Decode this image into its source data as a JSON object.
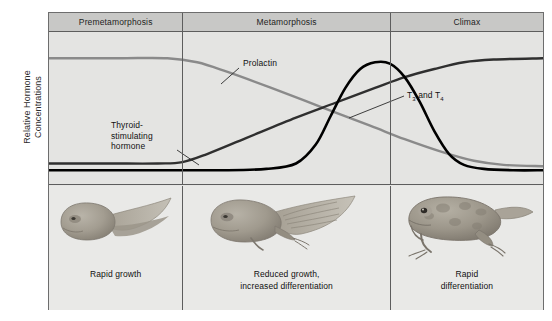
{
  "axis": {
    "y_title_line1": "Relative Hormone",
    "y_title_line2": "Concentrations"
  },
  "phases": [
    {
      "label": "Premetamorphosis"
    },
    {
      "label": "Metamorphosis"
    },
    {
      "label": "Climax"
    }
  ],
  "curve_labels": {
    "prolactin": "Prolactin",
    "tsh_line1": "Thyroid-",
    "tsh_line2": "stimulating",
    "tsh_line3": "hormone",
    "t3t4_prefix": "T",
    "t3t4_sub1": "3",
    "t3t4_mid": " and T",
    "t3t4_sub2": "4"
  },
  "stages": [
    {
      "caption_line1": "Rapid growth",
      "caption_line2": "",
      "art": "tadpole"
    },
    {
      "caption_line1": "Reduced growth,",
      "caption_line2": "increased differentiation",
      "art": "limbed-tadpole"
    },
    {
      "caption_line1": "Rapid",
      "caption_line2": "differentiation",
      "art": "froglet"
    }
  ],
  "colors": {
    "prolactin": "#8a8a8a",
    "tsh": "#2f2f2f",
    "t3t4": "#000000",
    "frame": "#6d6d6d",
    "header_band": "#c8c8c6",
    "plot_bg": "#e4e4e2",
    "strip_bg": "#e9e9e7"
  },
  "chart_data": {
    "type": "line",
    "title": "",
    "xlabel": "",
    "ylabel": "Relative Hormone Concentrations",
    "grid": false,
    "legend": "inline-annotations",
    "x_categories": [
      "Premetamorphosis",
      "Metamorphosis",
      "Climax"
    ],
    "x_boundaries_pct": [
      0,
      27,
      69,
      100
    ],
    "ylim": [
      0,
      100
    ],
    "xlim": [
      0,
      100
    ],
    "series": [
      {
        "name": "Prolactin",
        "color": "#8a8a8a",
        "points": [
          [
            0,
            88
          ],
          [
            14,
            88
          ],
          [
            24,
            88
          ],
          [
            30,
            85
          ],
          [
            36,
            78
          ],
          [
            45,
            66
          ],
          [
            55,
            52
          ],
          [
            65,
            38
          ],
          [
            72,
            28
          ],
          [
            80,
            18
          ],
          [
            86,
            12
          ],
          [
            92,
            9
          ],
          [
            100,
            8
          ]
        ]
      },
      {
        "name": "Thyroid-stimulating hormone",
        "color": "#2f2f2f",
        "points": [
          [
            0,
            10
          ],
          [
            12,
            10
          ],
          [
            22,
            10
          ],
          [
            27,
            11
          ],
          [
            32,
            17
          ],
          [
            40,
            29
          ],
          [
            50,
            44
          ],
          [
            58,
            55
          ],
          [
            66,
            66
          ],
          [
            72,
            74
          ],
          [
            78,
            80
          ],
          [
            84,
            85
          ],
          [
            90,
            87
          ],
          [
            100,
            88
          ]
        ]
      },
      {
        "name": "T3 and T4",
        "color": "#000000",
        "points": [
          [
            0,
            5
          ],
          [
            20,
            5
          ],
          [
            35,
            5
          ],
          [
            44,
            6
          ],
          [
            50,
            10
          ],
          [
            54,
            24
          ],
          [
            57,
            45
          ],
          [
            60,
            66
          ],
          [
            63,
            80
          ],
          [
            66,
            85
          ],
          [
            69,
            84
          ],
          [
            72,
            74
          ],
          [
            75,
            56
          ],
          [
            78,
            34
          ],
          [
            81,
            17
          ],
          [
            84,
            9
          ],
          [
            88,
            6
          ],
          [
            94,
            5
          ],
          [
            100,
            5
          ]
        ]
      }
    ]
  }
}
